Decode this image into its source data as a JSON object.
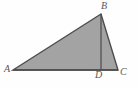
{
  "figure": {
    "kind": "geometry-diagram",
    "width": 137,
    "height": 89,
    "background_color": "#fefefe",
    "fill_color": "#a3a3a3",
    "stroke_color": "#4c4c4c",
    "label_color": "#585858",
    "stroke_width": 1.4,
    "points": {
      "A": {
        "x": 13,
        "y": 70
      },
      "B": {
        "x": 101,
        "y": 14
      },
      "C": {
        "x": 118,
        "y": 70
      },
      "D": {
        "x": 101,
        "y": 70
      }
    },
    "polygon_points": "13,70 101,14 118,70",
    "altitude": {
      "from": "B",
      "to": "D",
      "x": 101,
      "y1": 14,
      "y2": 70
    },
    "base": {
      "from": "A",
      "to": "C",
      "x1": 13,
      "x2": 118,
      "y": 70
    },
    "labels": {
      "A": "A",
      "B": "B",
      "C": "C",
      "D": "D"
    }
  }
}
